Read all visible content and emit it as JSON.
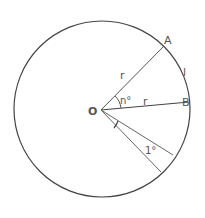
{
  "diagram": {
    "labels": {
      "center": "O",
      "point_a": "A",
      "point_b": "B",
      "radius_oa": "r",
      "radius_ob": "r",
      "arc_ab": "l",
      "angle_aob": "n°",
      "unit_angle": "1°"
    },
    "colors": {
      "stroke": "#444444",
      "text": "#555555"
    }
  }
}
